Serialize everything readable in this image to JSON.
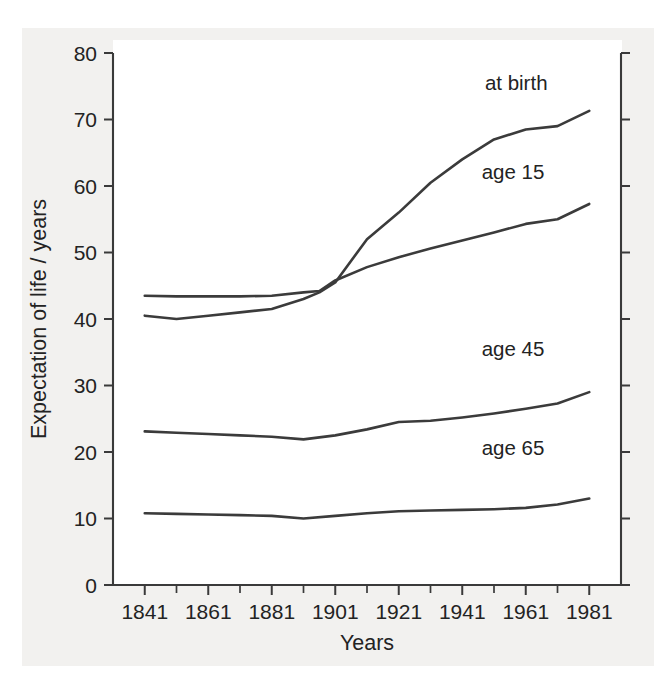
{
  "chart_data": {
    "type": "line",
    "title": "",
    "xlabel": "Years",
    "ylabel": "Expectation of life / years",
    "xlim": [
      1831,
      1991
    ],
    "ylim": [
      0,
      80
    ],
    "xticks": [
      1841,
      1861,
      1881,
      1901,
      1921,
      1941,
      1961,
      1981
    ],
    "xtick_labels": [
      "1841",
      "1861",
      "1881",
      "1901",
      "1921",
      "1941",
      "1961",
      "1981"
    ],
    "x_minor_tick_interval": 10,
    "yticks": [
      0,
      10,
      20,
      30,
      40,
      50,
      60,
      70,
      80
    ],
    "ytick_labels": [
      "0",
      "10",
      "20",
      "30",
      "40",
      "50",
      "60",
      "70",
      "80"
    ],
    "grid": false,
    "legend_position": "inline-right-labels",
    "line_color": "#3b3b3b",
    "background_color": "#ffffff",
    "series": [
      {
        "name": "at birth",
        "label": "at birth",
        "label_x": 1958,
        "label_y": 74.5,
        "x": [
          1841,
          1851,
          1861,
          1871,
          1881,
          1891,
          1896,
          1901,
          1911,
          1921,
          1931,
          1941,
          1951,
          1961,
          1971,
          1981
        ],
        "values": [
          40.5,
          40.0,
          40.5,
          41.0,
          41.5,
          43.0,
          44.0,
          45.5,
          52.0,
          56.0,
          60.5,
          64.0,
          67.0,
          68.5,
          69.0,
          71.3
        ]
      },
      {
        "name": "age 15",
        "label": "age 15",
        "label_x": 1957,
        "label_y": 61.0,
        "x": [
          1841,
          1851,
          1861,
          1871,
          1881,
          1891,
          1896,
          1901,
          1911,
          1921,
          1931,
          1941,
          1951,
          1961,
          1971,
          1981
        ],
        "values": [
          43.5,
          43.4,
          43.4,
          43.4,
          43.5,
          44.0,
          44.2,
          45.8,
          47.8,
          49.3,
          50.6,
          51.8,
          53.0,
          54.3,
          55.0,
          57.3
        ]
      },
      {
        "name": "age 45",
        "label": "age 45",
        "label_x": 1957,
        "label_y": 34.5,
        "x": [
          1841,
          1851,
          1861,
          1871,
          1881,
          1891,
          1901,
          1911,
          1921,
          1931,
          1941,
          1951,
          1961,
          1971,
          1981
        ],
        "values": [
          23.1,
          22.9,
          22.7,
          22.5,
          22.3,
          21.9,
          22.5,
          23.4,
          24.5,
          24.7,
          25.2,
          25.8,
          26.5,
          27.3,
          29.0
        ]
      },
      {
        "name": "age 65",
        "label": "age 65",
        "label_x": 1957,
        "label_y": 19.5,
        "x": [
          1841,
          1851,
          1861,
          1871,
          1881,
          1891,
          1901,
          1911,
          1921,
          1931,
          1941,
          1951,
          1961,
          1971,
          1981
        ],
        "values": [
          10.8,
          10.7,
          10.6,
          10.5,
          10.4,
          10.0,
          10.4,
          10.8,
          11.1,
          11.2,
          11.3,
          11.4,
          11.6,
          12.1,
          13.0
        ]
      }
    ]
  },
  "axes": {
    "y_title": "Expectation of life / years",
    "x_title": "Years"
  }
}
